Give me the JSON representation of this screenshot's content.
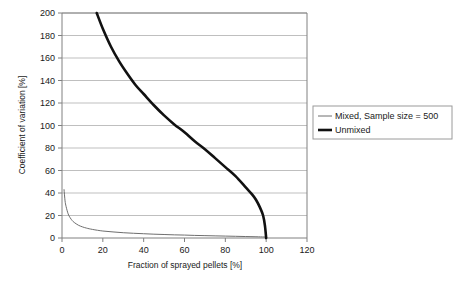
{
  "chart_data": {
    "type": "line",
    "title": "",
    "xlabel": "Fraction of sprayed pellets [%]",
    "ylabel": "Coefficient of variation [%]",
    "xlim": [
      0,
      120
    ],
    "ylim": [
      0,
      200
    ],
    "xticks": [
      0,
      20,
      40,
      60,
      80,
      100,
      120
    ],
    "yticks": [
      0,
      20,
      40,
      60,
      80,
      100,
      120,
      140,
      160,
      180,
      200
    ],
    "xtick_labels": [
      "0",
      "20",
      "40",
      "60",
      "80",
      "100",
      "120"
    ],
    "ytick_labels": [
      "0",
      "20",
      "40",
      "60",
      "80",
      "100",
      "120",
      "140",
      "160",
      "180",
      "200"
    ],
    "grid": "horizontal",
    "legend_position": "right-outside",
    "series": [
      {
        "name": "Mixed, Sample size = 500",
        "color": "#6e6e6e",
        "line_width": 1,
        "x": [
          1,
          1.5,
          2,
          3,
          4,
          5,
          6,
          8,
          10,
          12,
          15,
          20,
          25,
          30,
          35,
          40,
          45,
          50,
          55,
          60,
          65,
          70,
          75,
          80,
          85,
          90,
          95,
          99,
          100
        ],
        "y": [
          43,
          33,
          28,
          21.5,
          18,
          15.5,
          13.8,
          11.4,
          9.9,
          8.8,
          7.6,
          6.2,
          5.4,
          4.7,
          4.2,
          3.8,
          3.4,
          3.1,
          2.8,
          2.6,
          2.3,
          2.1,
          1.9,
          1.7,
          1.5,
          1.3,
          1.1,
          0.9,
          0.8
        ]
      },
      {
        "name": "Unmixed",
        "color": "#111111",
        "line_width": 2.6,
        "x": [
          17,
          20,
          24,
          28,
          32,
          36,
          40,
          45,
          50,
          55,
          60,
          65,
          70,
          75,
          80,
          85,
          90,
          93,
          95,
          97,
          98.5,
          99.4,
          100
        ],
        "y": [
          200,
          186,
          170,
          157,
          146,
          136,
          128,
          118,
          109,
          101,
          94,
          86,
          79,
          71,
          63,
          55,
          45,
          39,
          34,
          27,
          20,
          11,
          0
        ]
      }
    ],
    "legend_entries": [
      {
        "label": "Mixed, Sample size = 500",
        "color": "#6e6e6e",
        "line_width": 1
      },
      {
        "label": "Unmixed",
        "color": "#111111",
        "line_width": 2.6
      }
    ]
  }
}
